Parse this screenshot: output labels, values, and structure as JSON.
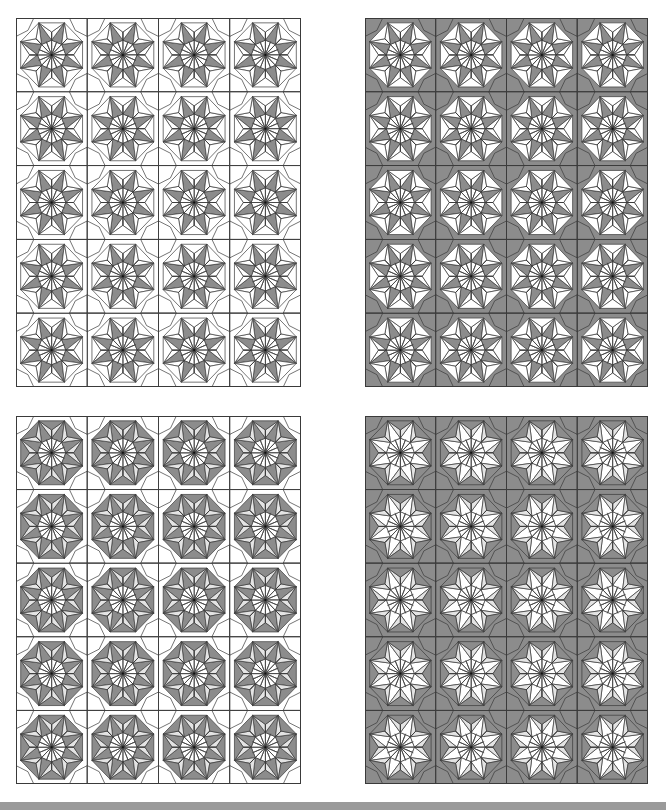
{
  "colors": {
    "dark": "#8c8c8c",
    "light": "#e4e4e4",
    "white": "#ffffff",
    "line": "#3a3a3a",
    "footer": "#9a9a9a"
  },
  "grid": {
    "cols": 4,
    "rows": 5,
    "tile_w": 71.25,
    "tile_h": 73.8
  },
  "panels": [
    {
      "id": "top-left",
      "x": 16,
      "y": 18,
      "w": 285,
      "h": 369,
      "scheme": {
        "corner": "white",
        "outerRing": "white",
        "star": "dark",
        "starSide": "white",
        "octaInner": "white",
        "octaOuter": "white"
      }
    },
    {
      "id": "top-right",
      "x": 365,
      "y": 18,
      "w": 283,
      "h": 369,
      "scheme": {
        "corner": "dark",
        "outerRing": "white",
        "star": "dark",
        "starSide": "white",
        "octaInner": "white",
        "octaOuter": "white"
      }
    },
    {
      "id": "bottom-left",
      "x": 16,
      "y": 416,
      "w": 285,
      "h": 368,
      "scheme": {
        "corner": "white",
        "outerRing": "light",
        "star": "dark",
        "starSide": "dark",
        "octaInner": "white",
        "octaOuter": "light"
      }
    },
    {
      "id": "bottom-right",
      "x": 365,
      "y": 416,
      "w": 283,
      "h": 368,
      "scheme": {
        "corner": "dark",
        "outerRing": "light",
        "star": "white",
        "starSide": "dark",
        "octaInner": "white",
        "octaOuter": "light"
      }
    }
  ]
}
